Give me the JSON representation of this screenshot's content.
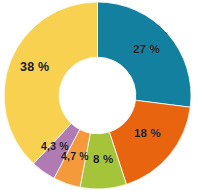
{
  "chart_data": {
    "type": "pie",
    "variant": "donut",
    "title": "",
    "subtitle": "",
    "xlabel": "",
    "ylabel": "",
    "legend": "none",
    "grid": false,
    "value_suffix": "%",
    "decimal_separator": ",",
    "start_angle_deg": 0,
    "direction": "clockwise",
    "inner_radius_ratio": 0.41,
    "categories": [
      "27 %",
      "18 %",
      "8 %",
      "4,7 %",
      "4,3 %",
      "38 %"
    ],
    "values": [
      27,
      18,
      8,
      4.7,
      4.3,
      38
    ],
    "colors": [
      "#1480a0",
      "#e9640f",
      "#a6c43a",
      "#f59a3a",
      "#b07bb3",
      "#f7d14f"
    ],
    "slices": [
      {
        "label": "27 %",
        "value": 27,
        "color": "#1480a0"
      },
      {
        "label": "18 %",
        "value": 18,
        "color": "#e9640f"
      },
      {
        "label": "8 %",
        "value": 8,
        "color": "#a6c43a"
      },
      {
        "label": "4,7 %",
        "value": 4.7,
        "color": "#f59a3a"
      },
      {
        "label": "4,3 %",
        "value": 4.3,
        "color": "#b07bb3"
      },
      {
        "label": "38 %",
        "value": 38,
        "color": "#f7d14f"
      }
    ],
    "background": "#ffffff",
    "label_color": "#1a1a1a"
  }
}
